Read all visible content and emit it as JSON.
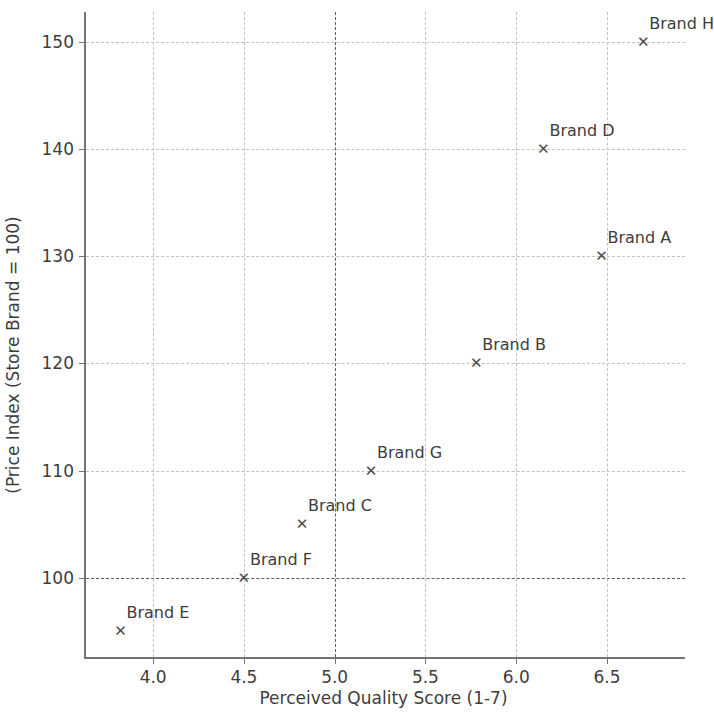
{
  "chart_data": {
    "type": "scatter",
    "title": "",
    "xlabel": "Perceived Quality Score (1-7)",
    "ylabel": "(Price Index (Store Brand = 100)",
    "xlim": [
      3.63,
      6.93
    ],
    "ylim": [
      92.6,
      152.8
    ],
    "xticks": [
      "4.0",
      "4.5",
      "5.0",
      "5.5",
      "6.0",
      "6.5"
    ],
    "xtick_values": [
      4.0,
      4.5,
      5.0,
      5.5,
      6.0,
      6.5
    ],
    "yticks": [
      "100",
      "110",
      "120",
      "130",
      "140",
      "150"
    ],
    "ytick_values": [
      100,
      110,
      120,
      130,
      140,
      150
    ],
    "grid": true,
    "legend": "none",
    "marker": "x",
    "marker_color": "#4a4a4a",
    "grid_color": "#c2c2c2",
    "reference_line_color": "#5c5c5c",
    "reference_lines": {
      "horizontal": 100,
      "vertical": 5.0
    },
    "points": [
      {
        "label": "Brand H",
        "x": 6.7,
        "y": 150
      },
      {
        "label": "Brand D",
        "x": 6.15,
        "y": 140
      },
      {
        "label": "Brand A",
        "x": 6.47,
        "y": 130
      },
      {
        "label": "Brand B",
        "x": 5.78,
        "y": 120
      },
      {
        "label": "Brand G",
        "x": 5.2,
        "y": 110
      },
      {
        "label": "Brand C",
        "x": 4.82,
        "y": 105
      },
      {
        "label": "Brand F",
        "x": 4.5,
        "y": 100
      },
      {
        "label": "Brand E",
        "x": 3.82,
        "y": 95
      }
    ]
  }
}
